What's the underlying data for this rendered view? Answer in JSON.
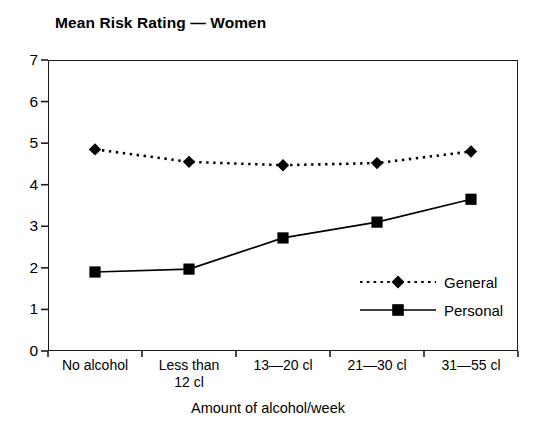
{
  "chart_data": {
    "type": "line",
    "title": "Mean Risk Rating — Women",
    "xlabel": "Amount of alcohol/week",
    "ylabel": "",
    "ylim": [
      0,
      7
    ],
    "yticks": [
      0,
      1,
      2,
      3,
      4,
      5,
      6,
      7
    ],
    "ytick_labels": [
      "0",
      "1",
      "2",
      "3",
      "4",
      "5",
      "6",
      "7"
    ],
    "grid": false,
    "legend_position": "inside-lower-right",
    "categories": [
      "No alcohol",
      "Less than\n12 cl",
      "13—20 cl",
      "21—30 cl",
      "31—55 cl"
    ],
    "series": [
      {
        "name": "General",
        "values": [
          4.85,
          4.55,
          4.47,
          4.52,
          4.8
        ],
        "marker": "diamond",
        "linestyle": "dotted",
        "color": "#000000"
      },
      {
        "name": "Personal",
        "values": [
          1.9,
          1.97,
          2.72,
          3.1,
          3.65
        ],
        "marker": "square",
        "linestyle": "solid",
        "color": "#000000"
      }
    ]
  },
  "legend": {
    "entries": [
      {
        "label": "General"
      },
      {
        "label": "Personal"
      }
    ]
  },
  "colors": {
    "ink": "#1b1b1b",
    "background": "#ffffff",
    "series": "#000000"
  }
}
